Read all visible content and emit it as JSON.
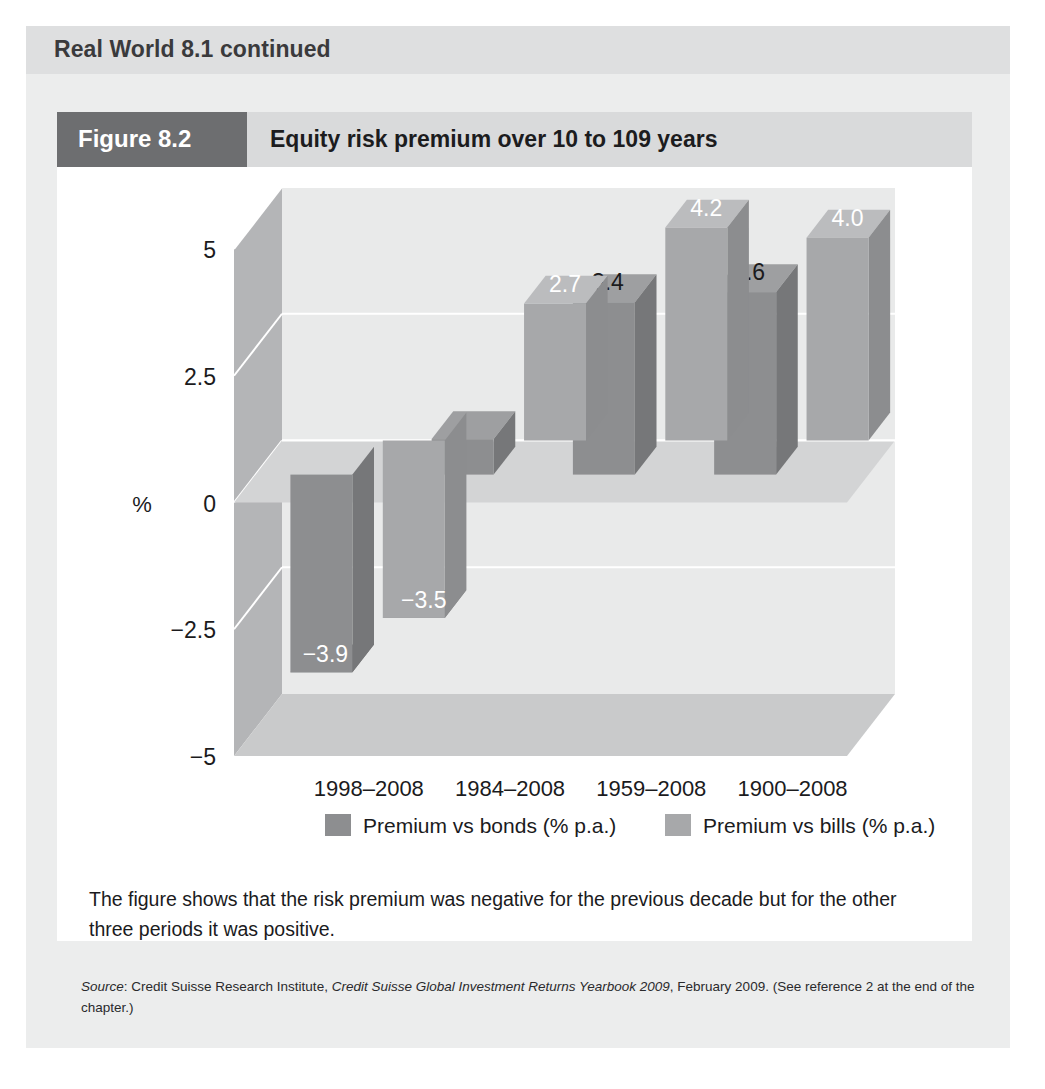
{
  "box": {
    "header_title": "Real World 8.1 continued"
  },
  "figure": {
    "tag": "Figure 8.2",
    "title": "Equity risk premium over 10 to 109 years",
    "caption": "The figure shows that the risk premium was negative for the previous decade but for the other three periods it was positive."
  },
  "source": {
    "label": "Source",
    "colon": ": ",
    "publisher": "Credit Suisse Research Institute, ",
    "work": "Credit Suisse Global Investment Returns Yearbook 2009",
    "tail": ", February 2009. (See reference 2 at the end of the chapter.)"
  },
  "chart_data": {
    "type": "bar",
    "title": "Equity risk premium over 10 to 109 years",
    "xlabel": "",
    "ylabel": "%",
    "ylim": [
      -5,
      5
    ],
    "yticks": [
      "5",
      "2.5",
      "0",
      "−2.5",
      "−5"
    ],
    "ytick_values": [
      5,
      2.5,
      0,
      -2.5,
      -5
    ],
    "grid": true,
    "legend_position": "bottom",
    "categories": [
      "1998–2008",
      "1984–2008",
      "1959–2008",
      "1900–2008"
    ],
    "series": [
      {
        "name": "Premium vs bonds (% p.a.)",
        "color": "#8d8e90",
        "values": [
          -3.9,
          0.7,
          3.4,
          3.6
        ],
        "labels": [
          "−3.9",
          "",
          "3.4",
          "3.6"
        ],
        "label_colors": [
          "#ffffff",
          "",
          "#1b1b1d",
          "#1b1b1d"
        ]
      },
      {
        "name": "Premium vs bills (% p.a.)",
        "color": "#a7a8aa",
        "values": [
          -3.5,
          2.7,
          4.2,
          4.0
        ],
        "labels": [
          "−3.5",
          "2.7",
          "4.2",
          "4.0"
        ],
        "label_colors": [
          "#ffffff",
          "#ffffff",
          "#ffffff",
          "#ffffff"
        ]
      }
    ]
  }
}
